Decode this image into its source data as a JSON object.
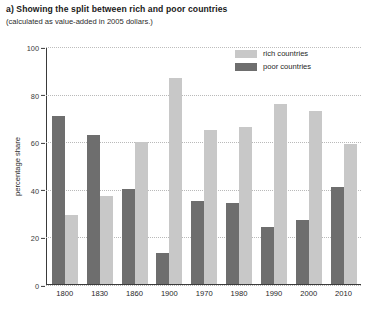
{
  "header": {
    "title": "a) Showing the split between rich and poor countries",
    "subtitle": "(calculated as value-added in 2005 dollars.)"
  },
  "legend": {
    "items": [
      {
        "label": "rich countries",
        "color": "#c8c8c8",
        "swatch_name": "legend-swatch-rich"
      },
      {
        "label": "poor countries",
        "color": "#6e6e6e",
        "swatch_name": "legend-swatch-poor"
      }
    ]
  },
  "axes": {
    "ylabel": "percentage share",
    "yticks": [
      "0",
      "20",
      "40",
      "60",
      "80",
      "100"
    ]
  },
  "chart_data": {
    "type": "bar",
    "title": "a) Showing the split between rich and poor countries",
    "subtitle": "(calculated as value-added in 2005 dollars.)",
    "xlabel": "",
    "ylabel": "percentage share",
    "ylim": [
      0,
      100
    ],
    "ytick_step": 20,
    "grid": true,
    "grid_style": "dotted-horizontal",
    "legend_position": "top-right-inside",
    "bar_order_in_group": [
      "poor countries",
      "rich countries"
    ],
    "categories": [
      "1800",
      "1830",
      "1860",
      "1900",
      "1970",
      "1980",
      "1990",
      "2000",
      "2010"
    ],
    "series": [
      {
        "name": "poor countries",
        "color": "#6e6e6e",
        "values": [
          71,
          63,
          40,
          13,
          35,
          34,
          24,
          27,
          41
        ]
      },
      {
        "name": "rich countries",
        "color": "#c8c8c8",
        "values": [
          29,
          37,
          60,
          87,
          65,
          66,
          76,
          73,
          59
        ]
      }
    ]
  }
}
